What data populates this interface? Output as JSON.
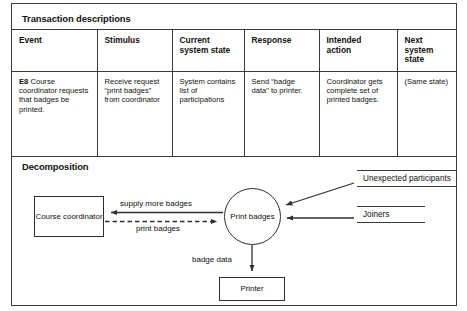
{
  "sections": {
    "transaction": {
      "title": "Transaction descriptions",
      "columns": [
        "Event",
        "Stimulus",
        "Current\nsystem state",
        "Response",
        "Intended\naction",
        "Next\nsystem state"
      ],
      "columns_display": {
        "c0": "Event",
        "c1": "Stimulus",
        "c2_line1": "Current",
        "c2_line2": "system state",
        "c3": "Response",
        "c4_line1": "Intended",
        "c4_line2": "action",
        "c5_line1": "Next",
        "c5_line2": "system state"
      },
      "rows": [
        {
          "event_id": "E8",
          "event_text": "Course coordinator requests that badges be printed.",
          "stimulus": "Receive request “print badges” from coordinator",
          "current_system_state": "System contains list of participations",
          "response": "Send “badge data” to printer.",
          "intended_action": "Coordinator gets complete set of printed badges.",
          "next_system_state": "(Same state)"
        }
      ]
    },
    "decomposition": {
      "title": "Decomposition",
      "nodes": {
        "coordinator": "Course coordinator",
        "process": "Print badges",
        "printer": "Printer"
      },
      "entities": [
        "Unexpected participants",
        "Joiners"
      ],
      "flows": [
        {
          "label": "supply more badges",
          "style": "solid",
          "direction": "process-to-coordinator"
        },
        {
          "label": "print badges",
          "style": "dashed",
          "direction": "coordinator-to-process"
        },
        {
          "label": "badge data",
          "style": "solid",
          "direction": "process-to-printer"
        }
      ]
    }
  },
  "colors": {
    "frame": "#3a3a3a",
    "ink": "#111111",
    "stroke": "#2f2f2f",
    "background": "#ffffff"
  }
}
